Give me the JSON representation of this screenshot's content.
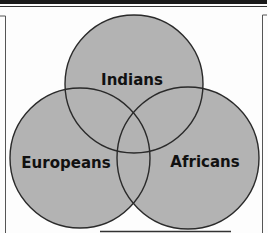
{
  "diagram": {
    "type": "venn",
    "sets": [
      {
        "label": "Indians",
        "cx": 134,
        "cy": 84,
        "r": 69
      },
      {
        "label": "Europeans",
        "cx": 80,
        "cy": 158,
        "r": 70
      },
      {
        "label": "Africans",
        "cx": 188,
        "cy": 158,
        "r": 71
      }
    ],
    "fill_color": "#b3b3b3",
    "stroke_color": "#2a2a2a"
  }
}
